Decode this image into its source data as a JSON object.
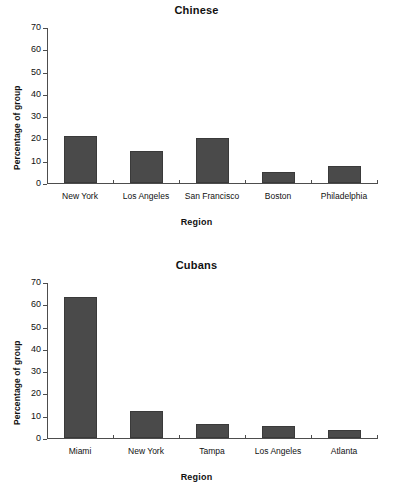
{
  "page": {
    "background_color": "#ffffff",
    "bar_color": "#4a4a4a",
    "axis_color": "#4d4d4d",
    "text_color": "#111111"
  },
  "chart_data": [
    {
      "type": "bar",
      "title": "Chinese",
      "xlabel": "Region",
      "ylabel": "Percentage of group",
      "categories": [
        "New York",
        "Los Angeles",
        "San Francisco",
        "Boston",
        "Philadelphia"
      ],
      "values": [
        21,
        14.5,
        20,
        5,
        7.5
      ],
      "ylim": [
        0,
        70
      ],
      "yticks": [
        0,
        10,
        20,
        30,
        40,
        50,
        60,
        70
      ],
      "ytick_labels": [
        "0",
        "10",
        "20",
        "30",
        "40",
        "50",
        "60",
        "70"
      ],
      "grid": false,
      "legend": "none"
    },
    {
      "type": "bar",
      "title": "Cubans",
      "xlabel": "Region",
      "ylabel": "Percentage of group",
      "categories": [
        "Miami",
        "New York",
        "Tampa",
        "Los Angeles",
        "Atlanta"
      ],
      "values": [
        63.5,
        12.3,
        6.3,
        5.6,
        3.5
      ],
      "ylim": [
        0,
        70
      ],
      "yticks": [
        0,
        10,
        20,
        30,
        40,
        50,
        60,
        70
      ],
      "ytick_labels": [
        "0",
        "10",
        "20",
        "30",
        "40",
        "50",
        "60",
        "70"
      ],
      "grid": false,
      "legend": "none"
    }
  ]
}
